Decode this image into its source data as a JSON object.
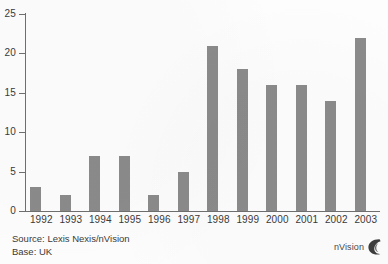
{
  "chart_data": {
    "type": "bar",
    "title": "",
    "xlabel": "",
    "ylabel": "",
    "categories": [
      "1992",
      "1993",
      "1994",
      "1995",
      "1996",
      "1997",
      "1998",
      "1999",
      "2000",
      "2001",
      "2002",
      "2003"
    ],
    "values": [
      3,
      2,
      7,
      7,
      2,
      5,
      21,
      18,
      16,
      16,
      14,
      22
    ],
    "ylim": [
      0,
      25
    ],
    "yticks": [
      0,
      5,
      10,
      15,
      20,
      25
    ],
    "ytick_labels": [
      "0",
      "5",
      "10",
      "15",
      "20",
      "25"
    ],
    "grid": false,
    "legend": false,
    "bar_color": "#8b8b8b",
    "axis_color": "#6f6f6f"
  },
  "footer": {
    "source_line": "Source: Lexis Nexis/nVision",
    "base_line": "Base: UK"
  },
  "logo": {
    "text": "nVision",
    "mark": "nvision-swirl-icon"
  }
}
